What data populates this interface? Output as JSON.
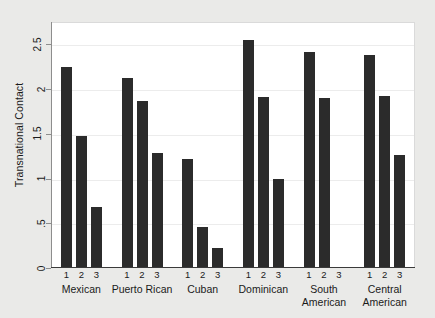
{
  "chart_data": {
    "type": "bar",
    "title": "",
    "subtitle": "",
    "xlabel": "",
    "ylabel": "Transnational Contact",
    "ylim": [
      0,
      2.75
    ],
    "ytick_values": [
      0,
      0.5,
      1,
      1.5,
      2,
      2.5
    ],
    "ytick_labels": [
      "0",
      ".5",
      "1",
      "1.5",
      "2",
      "2.5"
    ],
    "grid": "horizontal",
    "legend": "none",
    "bar_color": "#2b2b2b",
    "plot_background": "#ffffff",
    "figure_background": "#eaeae8",
    "group_label": "National origin group",
    "subgroup_labels": [
      "1",
      "2",
      "3"
    ],
    "categories": [
      "Mexican",
      "Puerto Rican",
      "Cuban",
      "Dominican",
      "South American",
      "Central American"
    ],
    "category_label_lines": [
      [
        "Mexican"
      ],
      [
        "Puerto Rican"
      ],
      [
        "Cuban"
      ],
      [
        "Dominican"
      ],
      [
        "South",
        "American"
      ],
      [
        "Central",
        "American"
      ]
    ],
    "series": [
      {
        "name": "1",
        "values": [
          2.25,
          2.12,
          1.22,
          2.55,
          2.42,
          2.38
        ]
      },
      {
        "name": "2",
        "values": [
          1.48,
          1.87,
          0.46,
          1.91,
          1.9,
          1.92
        ]
      },
      {
        "name": "3",
        "values": [
          0.68,
          1.29,
          0.22,
          1.0,
          null,
          1.26
        ]
      }
    ],
    "groups": [
      {
        "category": "Mexican",
        "bars": [
          2.25,
          1.48,
          0.68
        ]
      },
      {
        "category": "Puerto Rican",
        "bars": [
          2.12,
          1.87,
          1.29
        ]
      },
      {
        "category": "Cuban",
        "bars": [
          1.22,
          0.46,
          0.22
        ]
      },
      {
        "category": "Dominican",
        "bars": [
          2.55,
          1.91,
          1.0
        ]
      },
      {
        "category": "South American",
        "bars": [
          2.42,
          1.9,
          null
        ]
      },
      {
        "category": "Central American",
        "bars": [
          2.38,
          1.92,
          1.26
        ]
      }
    ]
  }
}
